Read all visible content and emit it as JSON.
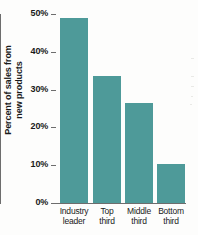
{
  "chart_data": {
    "type": "bar",
    "title": "",
    "xlabel": "",
    "ylabel": "Percent of sales from new products",
    "ylabel_lines": [
      "Percent of sales from",
      "new products"
    ],
    "categories": [
      "Industry leader",
      "Top third",
      "Middle third",
      "Bottom third"
    ],
    "category_lines": [
      [
        "Industry",
        "leader"
      ],
      [
        "Top",
        "third"
      ],
      [
        "Middle",
        "third"
      ],
      [
        "Bottom",
        "third"
      ]
    ],
    "values": [
      49,
      33.5,
      26.5,
      10.4
    ],
    "value_labels": [
      "49%",
      "33.5%",
      "26.5%",
      "10.4%"
    ],
    "ylim": [
      0,
      50
    ],
    "ytick_values": [
      0,
      10,
      20,
      30,
      40,
      50
    ],
    "ytick_labels": [
      "0%",
      "10%",
      "20%",
      "30%",
      "40%",
      "50%"
    ],
    "grid": false,
    "legend": false,
    "bar_color": "#4e9a99",
    "axis_color": "#6d6d6d",
    "text_color": "#1a1a1a",
    "background_color": "#fdfdfc"
  }
}
